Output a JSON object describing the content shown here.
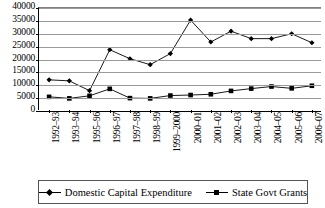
{
  "chart_data": {
    "type": "line",
    "title": "",
    "xlabel": "",
    "ylabel": "",
    "ylim": [
      0,
      40000
    ],
    "ytick_step": 5000,
    "yticks": [
      "0",
      "5000",
      "10000",
      "15000",
      "20000",
      "25000",
      "30000",
      "35000",
      "40000"
    ],
    "grid": true,
    "legend_position": "bottom",
    "categories": [
      "1992–93",
      "1993–94",
      "1995–96",
      "1996–97",
      "1997–98",
      "1998–99",
      "1999–2000",
      "2000–01",
      "2001–02",
      "2002–03",
      "2003–04",
      "2004–05",
      "2005–06",
      "2006–07"
    ],
    "series": [
      {
        "name": "Domestic Capital Expenditure",
        "marker": "diamond",
        "color": "#000000",
        "values": [
          12100,
          11700,
          7900,
          23800,
          20300,
          18000,
          22300,
          35300,
          26800,
          31000,
          28100,
          28100,
          30000,
          26500
        ]
      },
      {
        "name": "State Govt Grants",
        "marker": "square",
        "color": "#000000",
        "values": [
          5500,
          4900,
          5900,
          8600,
          5000,
          4900,
          6000,
          6200,
          6500,
          7800,
          8700,
          9500,
          8800,
          9800
        ]
      }
    ]
  },
  "legend": {
    "items": [
      {
        "label": "Domestic Capital Expenditure",
        "marker": "diamond-marker-icon"
      },
      {
        "label": "State Govt Grants",
        "marker": "square-marker-icon"
      }
    ]
  }
}
